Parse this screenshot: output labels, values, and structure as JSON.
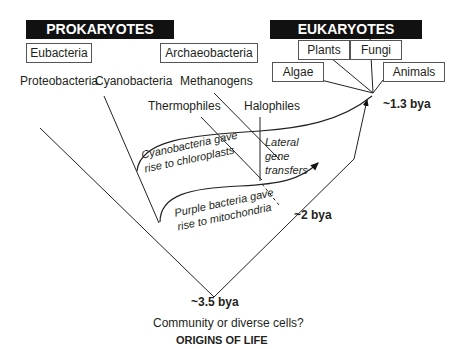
{
  "groups": {
    "prokaryotes": "PROKARYOTES",
    "eukaryotes": "EUKARYOTES"
  },
  "prokaryote_boxes": [
    "Eubacteria",
    "Archaeobacteria"
  ],
  "eukaryote_boxes": [
    "Plants",
    "Fungi",
    "Algae",
    "Animals"
  ],
  "lineages": [
    "Proteobacteria",
    "Cyanobacteria",
    "Methanogens",
    "Thermophiles",
    "Halophiles"
  ],
  "annotations": {
    "chloroplasts": [
      "Cyanobacteria gave",
      "rise to chloroplasts"
    ],
    "mitochondria": [
      "Purple bacteria gave",
      "rise to mitochondria"
    ],
    "lateral": [
      "Lateral",
      "gene",
      "transfers"
    ]
  },
  "times": {
    "t1": "~1.3 bya",
    "t2": "~2 bya",
    "t3": "~3.5 bya"
  },
  "footer": {
    "question": "Community or diverse cells?",
    "title": "ORIGINS OF LIFE"
  }
}
